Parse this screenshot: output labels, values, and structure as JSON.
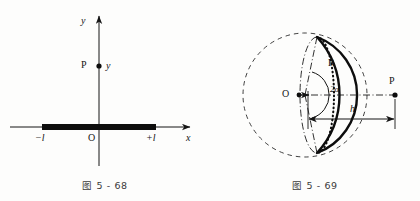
{
  "page": {
    "background_color": "#fdfdfc",
    "ink_color": "#141414"
  },
  "figure_left": {
    "caption": "图 5 - 68",
    "axis_y_label": "y",
    "axis_x_label": "x",
    "origin_label": "O",
    "point_label": "P",
    "point_coordinate_label": "y",
    "left_end_label": "−l",
    "right_end_label": "+l",
    "description": "Coordinate axes with a thick charged rod of half-length l lying along the x-axis from -l to +l, and a field point P on the y-axis."
  },
  "figure_right": {
    "caption": "图 5 - 69",
    "center_label": "O",
    "radius_label": "R",
    "half_angle_label": "2α",
    "height_label": "h",
    "point_label": "P",
    "description": "A spherical cap (solid lens) cut from a dashed sphere of radius R about center O, subtending full angle 2α, at distance h to the field point P on the axis."
  }
}
